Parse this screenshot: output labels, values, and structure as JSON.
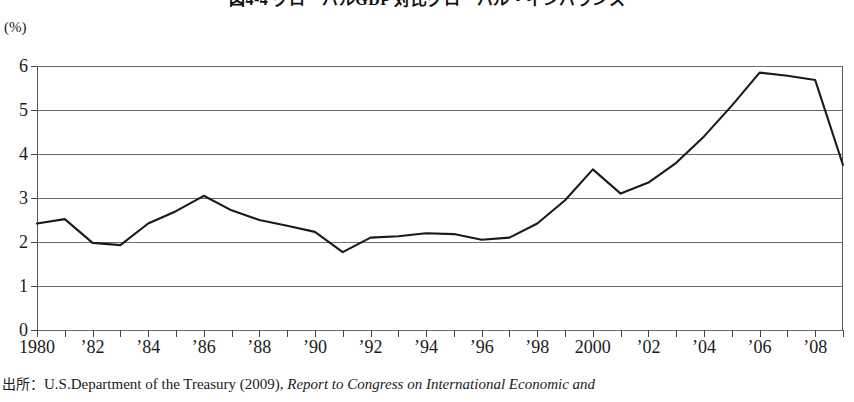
{
  "figure": {
    "title": "図4-4 グローバルGDP 対比グローバル・インバランス",
    "y_unit": "(%)",
    "source_label": "出所：",
    "source_text": "U.S.Department  of  the  Treasury  (2009),",
    "source_reference": "Report to Congress on International Economic and"
  },
  "chart_data": {
    "type": "line",
    "title": "図4-4 グローバルGDP 対比グローバル・インバランス",
    "xlabel": "",
    "ylabel": "(%)",
    "ylim": [
      0,
      6
    ],
    "xlim": [
      1980,
      2009
    ],
    "grid": true,
    "legend": null,
    "line_color": "#1a1a1a",
    "x": [
      1980,
      1981,
      1982,
      1983,
      1984,
      1985,
      1986,
      1987,
      1988,
      1989,
      1990,
      1991,
      1992,
      1993,
      1994,
      1995,
      1996,
      1997,
      1998,
      1999,
      2000,
      2001,
      2002,
      2003,
      2004,
      2005,
      2006,
      2007,
      2008,
      2009
    ],
    "values": [
      2.42,
      2.52,
      1.98,
      1.93,
      2.42,
      2.7,
      3.05,
      2.72,
      2.5,
      2.37,
      2.23,
      1.77,
      2.1,
      2.13,
      2.2,
      2.18,
      2.05,
      2.1,
      2.42,
      2.95,
      3.65,
      3.1,
      3.35,
      3.8,
      4.4,
      5.1,
      5.85,
      5.78,
      5.68,
      3.75
    ],
    "y_ticks": [
      0,
      1,
      2,
      3,
      4,
      5,
      6
    ],
    "y_tick_labels": [
      "0",
      "1",
      "2",
      "3",
      "4",
      "5",
      "6"
    ],
    "x_ticks": [
      1980,
      1981,
      1982,
      1983,
      1984,
      1985,
      1986,
      1987,
      1988,
      1989,
      1990,
      1991,
      1992,
      1993,
      1994,
      1995,
      1996,
      1997,
      1998,
      1999,
      2000,
      2001,
      2002,
      2003,
      2004,
      2005,
      2006,
      2007,
      2008,
      2009
    ],
    "x_labeled_ticks": [
      {
        "x": 1980,
        "label": "1980"
      },
      {
        "x": 1982,
        "label": "’82"
      },
      {
        "x": 1984,
        "label": "’84"
      },
      {
        "x": 1986,
        "label": "’86"
      },
      {
        "x": 1988,
        "label": "’88"
      },
      {
        "x": 1990,
        "label": "’90"
      },
      {
        "x": 1992,
        "label": "’92"
      },
      {
        "x": 1994,
        "label": "’94"
      },
      {
        "x": 1996,
        "label": "’96"
      },
      {
        "x": 1998,
        "label": "’98"
      },
      {
        "x": 2000,
        "label": "2000"
      },
      {
        "x": 2002,
        "label": "’02"
      },
      {
        "x": 2004,
        "label": "’04"
      },
      {
        "x": 2006,
        "label": "’06"
      },
      {
        "x": 2008,
        "label": "’08"
      }
    ]
  }
}
